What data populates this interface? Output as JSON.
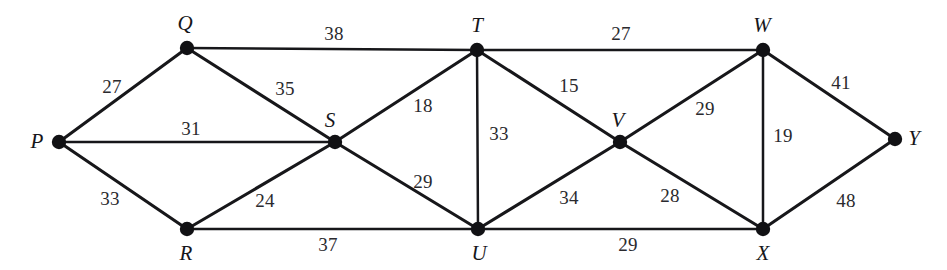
{
  "figure": {
    "type": "weighted-undirected-graph",
    "title": "",
    "background_color": "#ffffff",
    "stroke_color": "#17171a",
    "label_color": "#16161a"
  },
  "nodes": [
    {
      "id": "P",
      "label": "P",
      "x": 59,
      "y": 142,
      "label_x": 37,
      "label_y": 141
    },
    {
      "id": "Q",
      "label": "Q",
      "x": 187,
      "y": 48,
      "label_x": 185,
      "label_y": 23
    },
    {
      "id": "R",
      "label": "R",
      "x": 187,
      "y": 229,
      "label_x": 186,
      "label_y": 253
    },
    {
      "id": "S",
      "label": "S",
      "x": 335,
      "y": 142,
      "label_x": 330,
      "label_y": 120
    },
    {
      "id": "T",
      "label": "T",
      "x": 477,
      "y": 50,
      "label_x": 477,
      "label_y": 25
    },
    {
      "id": "U",
      "label": "U",
      "x": 478,
      "y": 229,
      "label_x": 479,
      "label_y": 253
    },
    {
      "id": "V",
      "label": "V",
      "x": 620,
      "y": 142,
      "label_x": 618,
      "label_y": 120
    },
    {
      "id": "W",
      "label": "W",
      "x": 763,
      "y": 50,
      "label_x": 762,
      "label_y": 25
    },
    {
      "id": "X",
      "label": "X",
      "x": 763,
      "y": 229,
      "label_x": 763,
      "label_y": 253
    },
    {
      "id": "Y",
      "label": "Y",
      "x": 895,
      "y": 139,
      "label_x": 914,
      "label_y": 138
    }
  ],
  "edges": [
    {
      "from": "P",
      "to": "Q",
      "weight": "27",
      "label_x": 112,
      "label_y": 86,
      "thin": false
    },
    {
      "from": "P",
      "to": "S",
      "weight": "31",
      "label_x": 191,
      "label_y": 128,
      "thin": true
    },
    {
      "from": "P",
      "to": "R",
      "weight": "33",
      "label_x": 110,
      "label_y": 198,
      "thin": false
    },
    {
      "from": "Q",
      "to": "S",
      "weight": "35",
      "label_x": 285,
      "label_y": 88,
      "thin": false
    },
    {
      "from": "Q",
      "to": "T",
      "weight": "38",
      "label_x": 334,
      "label_y": 33,
      "thin": true
    },
    {
      "from": "R",
      "to": "S",
      "weight": "24",
      "label_x": 265,
      "label_y": 200,
      "thin": false
    },
    {
      "from": "R",
      "to": "U",
      "weight": "37",
      "label_x": 328,
      "label_y": 244,
      "thin": true
    },
    {
      "from": "S",
      "to": "T",
      "weight": "18",
      "label_x": 423,
      "label_y": 105,
      "thin": false
    },
    {
      "from": "S",
      "to": "U",
      "weight": "29",
      "label_x": 423,
      "label_y": 181,
      "thin": false
    },
    {
      "from": "T",
      "to": "U",
      "weight": "33",
      "label_x": 499,
      "label_y": 133,
      "thin": true
    },
    {
      "from": "T",
      "to": "V",
      "weight": "15",
      "label_x": 569,
      "label_y": 85,
      "thin": false
    },
    {
      "from": "T",
      "to": "W",
      "weight": "27",
      "label_x": 621,
      "label_y": 33,
      "thin": true
    },
    {
      "from": "U",
      "to": "V",
      "weight": "34",
      "label_x": 569,
      "label_y": 197,
      "thin": false
    },
    {
      "from": "U",
      "to": "X",
      "weight": "29",
      "label_x": 628,
      "label_y": 244,
      "thin": true
    },
    {
      "from": "V",
      "to": "W",
      "weight": "29",
      "label_x": 705,
      "label_y": 108,
      "thin": false
    },
    {
      "from": "V",
      "to": "X",
      "weight": "28",
      "label_x": 670,
      "label_y": 195,
      "thin": false
    },
    {
      "from": "W",
      "to": "X",
      "weight": "19",
      "label_x": 783,
      "label_y": 135,
      "thin": true
    },
    {
      "from": "W",
      "to": "Y",
      "weight": "41",
      "label_x": 841,
      "label_y": 82,
      "thin": false
    },
    {
      "from": "X",
      "to": "Y",
      "weight": "48",
      "label_x": 846,
      "label_y": 200,
      "thin": false
    }
  ],
  "node_radius": 7.2
}
